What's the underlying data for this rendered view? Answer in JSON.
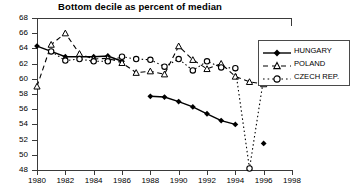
{
  "chart_data": {
    "type": "line",
    "title": "Bottom decile as percent of median",
    "xlabel": "",
    "ylabel": "",
    "xlim": [
      1980,
      1998
    ],
    "ylim": [
      48,
      68
    ],
    "xticks": [
      1980,
      1982,
      1984,
      1986,
      1988,
      1990,
      1992,
      1994,
      1996,
      1998
    ],
    "yticks": [
      48,
      50,
      52,
      54,
      56,
      58,
      60,
      62,
      64,
      66,
      68
    ],
    "grid": false,
    "legend_position": "right",
    "series": [
      {
        "name": "HUNGARY",
        "marker": "filled-diamond",
        "line": "solid",
        "color": "#000000",
        "x": [
          1980,
          1981,
          1982,
          1983,
          1984,
          1985,
          1986,
          1988,
          1989,
          1990,
          1991,
          1992,
          1993,
          1994,
          1996
        ],
        "y": [
          64.3,
          63.6,
          62.9,
          62.9,
          62.9,
          63.0,
          62.3,
          57.7,
          57.6,
          57.0,
          56.3,
          55.4,
          54.5,
          54.0,
          51.5
        ]
      },
      {
        "name": "POLAND",
        "marker": "open-triangle",
        "line": "dashed",
        "color": "#000000",
        "x": [
          1980,
          1981,
          1982,
          1983,
          1984,
          1985,
          1986,
          1987,
          1988,
          1989,
          1990,
          1991,
          1992,
          1993,
          1994,
          1995,
          1996
        ],
        "y": [
          59.0,
          64.5,
          66.0,
          63.3,
          62.6,
          62.7,
          62.1,
          60.8,
          61.0,
          60.6,
          64.3,
          62.5,
          61.3,
          62.0,
          60.3,
          59.6,
          59.3
        ]
      },
      {
        "name": "CZECH REP.",
        "marker": "open-circle",
        "line": "dotted",
        "color": "#000000",
        "x": [
          1981,
          1982,
          1983,
          1984,
          1985,
          1986,
          1987,
          1988,
          1989,
          1990,
          1991,
          1992,
          1993,
          1994,
          1995,
          1996
        ],
        "y": [
          63.6,
          62.4,
          62.6,
          62.3,
          62.3,
          62.9,
          62.6,
          62.5,
          61.6,
          62.6,
          61.1,
          62.3,
          61.5,
          61.4,
          48.2,
          60.1
        ]
      }
    ]
  },
  "legend": {
    "items": [
      {
        "label": "HUNGARY"
      },
      {
        "label": "POLAND"
      },
      {
        "label": "CZECH REP."
      }
    ]
  }
}
